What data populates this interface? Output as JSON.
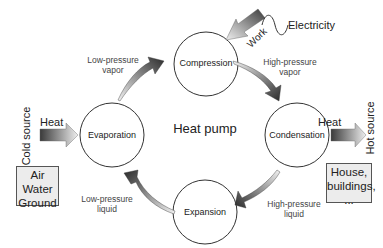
{
  "title": "Heat pump",
  "nodes": {
    "compression": "Compression",
    "condensation": "Condensation",
    "expansion": "Expansion",
    "evaporation": "Evaporation"
  },
  "flows": {
    "low_pressure_vapor": [
      "Low-pressure",
      "vapor"
    ],
    "high_pressure_vapor": [
      "High-pressure",
      "vapor"
    ],
    "high_pressure_liquid": [
      "High-pressure",
      "liquid"
    ],
    "low_pressure_liquid": [
      "Low-pressure",
      "liquid"
    ]
  },
  "work": {
    "label": "Work",
    "source": "Electricity",
    "icon": "sine-wave-icon"
  },
  "cold_side": {
    "label": "Cold source",
    "heat_label": "Heat",
    "examples": [
      "Air",
      "Water",
      "Ground"
    ]
  },
  "hot_side": {
    "label": "Hot source",
    "heat_label": "Heat",
    "examples": [
      "House,",
      "buildings,",
      "..."
    ]
  },
  "colors": {
    "circle_stroke": "#333333",
    "arrow_dark": "#2a2a2a",
    "arrow_light": "#e6e6e6",
    "box_fill": "#ececec",
    "box_border": "#555555"
  }
}
